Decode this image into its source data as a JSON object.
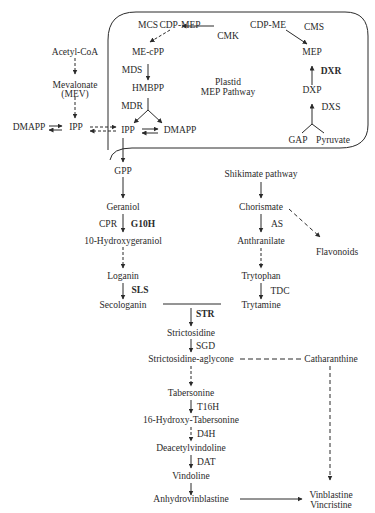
{
  "diagram": {
    "plastid_box": {
      "label_line1": "Plastid",
      "label_line2": "MEP Pathway"
    },
    "mep_nodes": {
      "cdp_mep": "CDP-MEP",
      "cdp_me": "CDP-ME",
      "me_cpp": "ME-cPP",
      "mep": "MEP",
      "hmbpp": "HMBPP",
      "dxp": "DXP",
      "ipp": "IPP",
      "dmapp": "DMAPP",
      "gap": "GAP",
      "pyruvate": "Pyruvate"
    },
    "mep_enzymes": {
      "mcs": "MCS",
      "cmk": "CMK",
      "cms": "CMS",
      "mds": "MDS",
      "mdr": "MDR",
      "dxr": "DXR",
      "dxs": "DXS"
    },
    "mev_nodes": {
      "acetyl_coa": "Acetyl-CoA",
      "mevalonate": "Mevalonate",
      "mev": "(MEV)",
      "ipp": "IPP",
      "dmapp": "DMAPP"
    },
    "terpenoid_branch": {
      "gpp": "GPP",
      "geraniol": "Geraniol",
      "cpr": "CPR",
      "g10h": "G10H",
      "hydroxygeraniol": "10-Hydroxygeraniol",
      "loganin": "Loganin",
      "sls": "SLS",
      "secologanin": "Secologanin"
    },
    "indole_branch": {
      "shikimate": "Shikimate pathway",
      "chorismate": "Chorismate",
      "as": "AS",
      "flavonoids": "Flavonoids",
      "anthranilate": "Anthranilate",
      "trytophan": "Trytophan",
      "tdc": "TDC",
      "trytamine": "Trytamine"
    },
    "alkaloid_branch": {
      "str": "STR",
      "strictosidine": "Strictosidine",
      "sgd": "SGD",
      "aglycone": "Strictosidine-aglycone",
      "catharanthine": "Catharanthine",
      "tabersonine": "Tabersonine",
      "t16h": "T16H",
      "hydroxy_tabersonine": "16-Hydroxy-Tabersonine",
      "d4h": "D4H",
      "deacetylvindoline": "Deacetylvindoline",
      "dat": "DAT",
      "vindoline": "Vindoline",
      "anhydrovinblastine": "Anhydrovinblastine",
      "vinblastine": "Vinblastine",
      "vincristine": "Vincristine"
    },
    "colors": {
      "line": "#2a2a2a",
      "text": "#2a2a2a",
      "background": "#ffffff"
    }
  }
}
